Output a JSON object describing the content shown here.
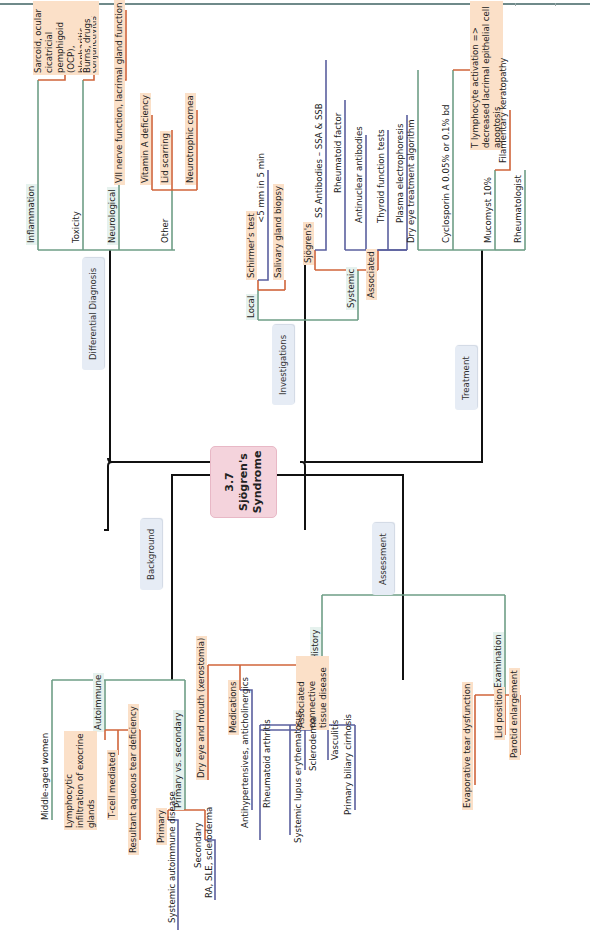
{
  "page": {
    "orientation": "rotated-90-ccw"
  },
  "central": {
    "title_line1": "3.7 Sjögren's",
    "title_line2": "Syndrome"
  },
  "colors": {
    "trunk": "#111111",
    "green": "#6e9e86",
    "orange": "#d0643a",
    "blue": "#5a5f9e",
    "orange_fill": "#fbe0c8",
    "branch_fill": "#e6ecf5",
    "central_fill": "#f4d3dc"
  },
  "branches": {
    "differential": {
      "label": "Differential Diagnosis",
      "children": {
        "inflammation": {
          "label": "Inflammation",
          "detail": "Sarcoid, ocular cicatricial pemphigoid (OCP), blepharitis, conjunctivitis"
        },
        "toxicity": {
          "label": "Toxicity",
          "detail": "Burns, drugs"
        },
        "neurological": {
          "label": "Neurological",
          "detail": "VII nerve function, lacrimal gland function"
        },
        "other": {
          "label": "Other",
          "items": [
            "Vitamin A deficiency",
            "Lid scarring",
            "Neurotrophic cornea"
          ]
        }
      }
    },
    "investigations": {
      "label": "Investigations",
      "local": {
        "label": "Local",
        "schirmer": "Schirmer's test",
        "schirmer_value": "<5 mm in 5 min",
        "biopsy": "Salivary gland biopsy"
      },
      "systemic": {
        "label": "Systemic",
        "sjogrens": {
          "label": "Sjögren's",
          "item": "SS Antibodies – SSA & SSB"
        },
        "associated": {
          "label": "Associated",
          "items": [
            "Rheumatoid factor",
            "Antinuclear antibodies",
            "Thyroid function tests",
            "Plasma electrophoresis"
          ]
        }
      }
    },
    "treatment": {
      "label": "Treatment",
      "children": {
        "algorithm": "Dry eye treatment algorithm",
        "cyclosporin": {
          "label": "Cyclosporin A 0.05% or 0.1% bd",
          "detail": "T lymphocyte activation => decreased lacrimal epithelial cell apoptosis"
        },
        "mucomyst": {
          "label": "Mucomyst 10%",
          "detail": "Filamentary keratopathy"
        },
        "rheumatologist": "Rheumatologist"
      }
    },
    "background": {
      "label": "Background",
      "middle_aged": "Middle-aged women",
      "autoimmune": {
        "label": "Autoimmune",
        "items": [
          "Lymphocytic infiltration of exocrine glands",
          "T-cell mediated",
          "Resultant aqueous tear deficiency"
        ]
      },
      "primary_secondary": {
        "label": "Primary vs. secondary",
        "primary": {
          "label": "Primary",
          "detail": "Systemic autoimmune disease"
        },
        "secondary": {
          "label": "Secondary",
          "detail": "RA, SLE, scleroderma"
        }
      }
    },
    "assessment": {
      "label": "Assessment",
      "history": {
        "label": "History",
        "dry_eye": "Dry eye and mouth (xerostomia)",
        "medications": {
          "label": "Medications",
          "detail": "Antihypertensives, anticholinergics"
        },
        "connective": {
          "label": "Associated connective tissue disease",
          "items": [
            "Rheumatoid arthritis",
            "Systemic lupus erythematosus",
            "Scleroderma",
            "Vasculitis",
            "Primary biliary cirrhosis"
          ]
        }
      },
      "examination": {
        "label": "Examination",
        "items": [
          "Evaporative tear dysfunction",
          "Lid position",
          "Parotid enlargement"
        ]
      }
    }
  }
}
